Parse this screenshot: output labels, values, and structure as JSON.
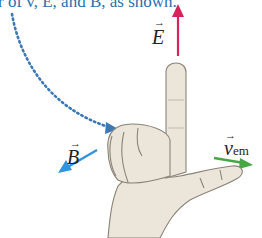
{
  "caption": "r of v, E, and B, as shown.",
  "labels": {
    "E": "E",
    "B": "B",
    "v": "v",
    "v_sub": "em",
    "arrow_glyph": "→"
  },
  "colors": {
    "E_arrow": "#d4245a",
    "B_arrow": "#2f95dc",
    "v_arrow": "#45a845",
    "dotted_guide": "#3a78b8",
    "caption_text": "#2a6fb0",
    "skin": "#ece6da",
    "skin_outline": "#8a8378"
  }
}
